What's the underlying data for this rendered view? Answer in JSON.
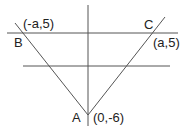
{
  "diagram": {
    "type": "geometry",
    "points": {
      "A": {
        "label": "A",
        "coord": "(0,-6)"
      },
      "B": {
        "label": "B",
        "coord": "(-a,5)"
      },
      "C": {
        "label": "C",
        "coord": "(a,5)"
      }
    },
    "colors": {
      "line": "#555555",
      "text": "#222222",
      "background": "#ffffff"
    }
  }
}
